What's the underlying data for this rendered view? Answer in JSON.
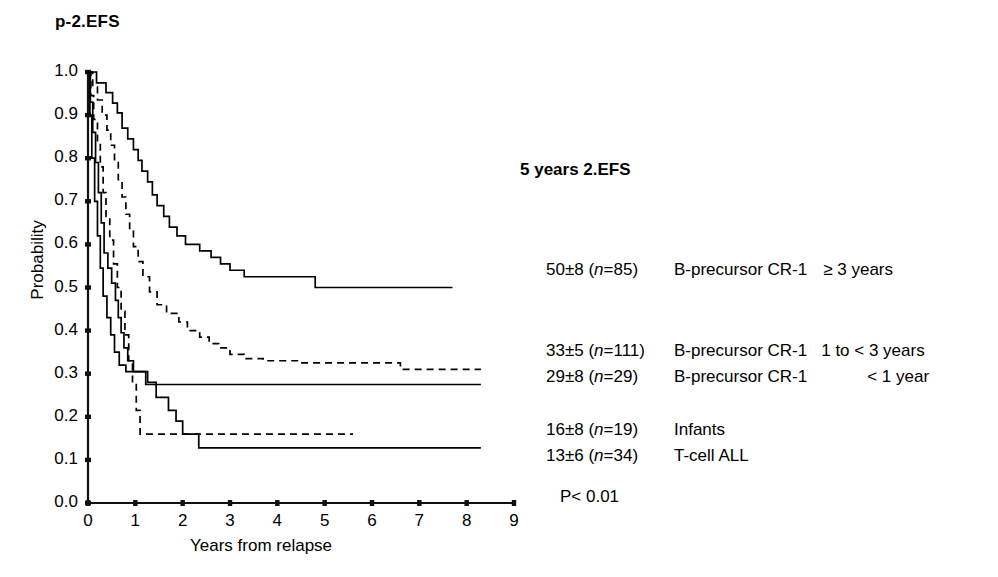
{
  "panel": {
    "title": "p-2.EFS"
  },
  "axes": {
    "ylabel": "Probability",
    "xlabel": "Years from relapse",
    "yticks": [
      "0.0",
      "0.1",
      "0.2",
      "0.3",
      "0.4",
      "0.5",
      "0.6",
      "0.7",
      "0.8",
      "0.9",
      "1.0"
    ],
    "xticks": [
      "0",
      "1",
      "2",
      "3",
      "4",
      "5",
      "6",
      "7",
      "8",
      "9"
    ]
  },
  "legend": {
    "title": "5 years 2.EFS",
    "pvalue": "P< 0.01",
    "entries": [
      {
        "stat": "50±8 (",
        "n_italic": "n",
        "stat_tail": "=85)",
        "group": "B-precursor CR-1",
        "duration": "≥ 3 years"
      },
      {
        "stat": "33±5 (",
        "n_italic": "n",
        "stat_tail": "=111)",
        "group": "B-precursor CR-1",
        "duration": "1 to < 3 years"
      },
      {
        "stat": "29±8 (",
        "n_italic": "n",
        "stat_tail": "=29)",
        "group": "B-precursor CR-1",
        "duration": "< 1 year"
      },
      {
        "stat": "16±8 (",
        "n_italic": "n",
        "stat_tail": "=19)",
        "group": "Infants",
        "duration": ""
      },
      {
        "stat": "13±6 (",
        "n_italic": "n",
        "stat_tail": "=34)",
        "group": "T-cell ALL",
        "duration": ""
      }
    ]
  },
  "chart_data": {
    "type": "line",
    "subtype": "kaplan-meier-step",
    "title": "p-2.EFS",
    "xlabel": "Years from relapse",
    "ylabel": "Probability",
    "xlim": [
      0,
      9
    ],
    "ylim": [
      0.0,
      1.0
    ],
    "xtick_values": [
      0,
      1,
      2,
      3,
      4,
      5,
      6,
      7,
      8,
      9
    ],
    "ytick_values": [
      0.0,
      0.1,
      0.2,
      0.3,
      0.4,
      0.5,
      0.6,
      0.7,
      0.8,
      0.9,
      1.0
    ],
    "grid": false,
    "legend_position": "right",
    "annotations": [
      "P< 0.01",
      "5 years 2.EFS"
    ],
    "series": [
      {
        "name": "B-precursor CR-1 ≥ 3 years",
        "n": 85,
        "five_year_efs": 50,
        "five_year_efs_se": 8,
        "style": "solid",
        "color": "#000000",
        "points": [
          [
            0.0,
            1.0
          ],
          [
            0.18,
            1.0
          ],
          [
            0.18,
            0.975
          ],
          [
            0.38,
            0.975
          ],
          [
            0.38,
            0.952
          ],
          [
            0.52,
            0.952
          ],
          [
            0.52,
            0.928
          ],
          [
            0.62,
            0.928
          ],
          [
            0.62,
            0.905
          ],
          [
            0.72,
            0.905
          ],
          [
            0.72,
            0.87
          ],
          [
            0.84,
            0.87
          ],
          [
            0.84,
            0.845
          ],
          [
            0.96,
            0.845
          ],
          [
            0.96,
            0.82
          ],
          [
            1.06,
            0.82
          ],
          [
            1.06,
            0.795
          ],
          [
            1.14,
            0.795
          ],
          [
            1.14,
            0.77
          ],
          [
            1.26,
            0.77
          ],
          [
            1.26,
            0.745
          ],
          [
            1.36,
            0.745
          ],
          [
            1.36,
            0.715
          ],
          [
            1.46,
            0.715
          ],
          [
            1.46,
            0.69
          ],
          [
            1.6,
            0.69
          ],
          [
            1.6,
            0.665
          ],
          [
            1.72,
            0.665
          ],
          [
            1.72,
            0.64
          ],
          [
            1.88,
            0.64
          ],
          [
            1.88,
            0.62
          ],
          [
            2.06,
            0.62
          ],
          [
            2.06,
            0.6
          ],
          [
            2.36,
            0.6
          ],
          [
            2.36,
            0.585
          ],
          [
            2.6,
            0.585
          ],
          [
            2.6,
            0.57
          ],
          [
            2.8,
            0.57
          ],
          [
            2.8,
            0.555
          ],
          [
            3.0,
            0.555
          ],
          [
            3.0,
            0.54
          ],
          [
            3.3,
            0.54
          ],
          [
            3.3,
            0.525
          ],
          [
            4.8,
            0.525
          ],
          [
            4.8,
            0.5
          ],
          [
            7.7,
            0.5
          ]
        ]
      },
      {
        "name": "B-precursor CR-1 1 to < 3 years",
        "n": 111,
        "five_year_efs": 33,
        "five_year_efs_se": 5,
        "style": "dashed",
        "color": "#000000",
        "points": [
          [
            0.0,
            1.0
          ],
          [
            0.1,
            1.0
          ],
          [
            0.1,
            0.965
          ],
          [
            0.2,
            0.965
          ],
          [
            0.2,
            0.935
          ],
          [
            0.3,
            0.935
          ],
          [
            0.3,
            0.9
          ],
          [
            0.4,
            0.9
          ],
          [
            0.4,
            0.865
          ],
          [
            0.48,
            0.865
          ],
          [
            0.48,
            0.83
          ],
          [
            0.56,
            0.83
          ],
          [
            0.56,
            0.79
          ],
          [
            0.64,
            0.79
          ],
          [
            0.64,
            0.75
          ],
          [
            0.72,
            0.75
          ],
          [
            0.72,
            0.71
          ],
          [
            0.8,
            0.71
          ],
          [
            0.8,
            0.67
          ],
          [
            0.88,
            0.67
          ],
          [
            0.88,
            0.63
          ],
          [
            0.96,
            0.63
          ],
          [
            0.96,
            0.595
          ],
          [
            1.06,
            0.595
          ],
          [
            1.06,
            0.56
          ],
          [
            1.16,
            0.56
          ],
          [
            1.16,
            0.525
          ],
          [
            1.3,
            0.525
          ],
          [
            1.3,
            0.49
          ],
          [
            1.46,
            0.49
          ],
          [
            1.46,
            0.46
          ],
          [
            1.66,
            0.46
          ],
          [
            1.66,
            0.44
          ],
          [
            1.92,
            0.44
          ],
          [
            1.92,
            0.42
          ],
          [
            2.1,
            0.42
          ],
          [
            2.1,
            0.4
          ],
          [
            2.36,
            0.4
          ],
          [
            2.36,
            0.385
          ],
          [
            2.56,
            0.385
          ],
          [
            2.56,
            0.37
          ],
          [
            2.76,
            0.37
          ],
          [
            2.76,
            0.36
          ],
          [
            3.0,
            0.36
          ],
          [
            3.0,
            0.345
          ],
          [
            3.3,
            0.345
          ],
          [
            3.3,
            0.335
          ],
          [
            3.7,
            0.335
          ],
          [
            3.7,
            0.33
          ],
          [
            4.5,
            0.33
          ],
          [
            4.5,
            0.325
          ],
          [
            6.6,
            0.325
          ],
          [
            6.6,
            0.31
          ],
          [
            8.3,
            0.31
          ]
        ]
      },
      {
        "name": "B-precursor CR-1 < 1 year",
        "n": 29,
        "five_year_efs": 29,
        "five_year_efs_se": 8,
        "style": "solid",
        "color": "#000000",
        "points": [
          [
            0.0,
            1.0
          ],
          [
            0.05,
            1.0
          ],
          [
            0.05,
            0.93
          ],
          [
            0.1,
            0.93
          ],
          [
            0.1,
            0.86
          ],
          [
            0.16,
            0.86
          ],
          [
            0.16,
            0.79
          ],
          [
            0.22,
            0.79
          ],
          [
            0.22,
            0.72
          ],
          [
            0.28,
            0.72
          ],
          [
            0.28,
            0.65
          ],
          [
            0.34,
            0.65
          ],
          [
            0.34,
            0.58
          ],
          [
            0.42,
            0.58
          ],
          [
            0.42,
            0.545
          ],
          [
            0.5,
            0.545
          ],
          [
            0.5,
            0.51
          ],
          [
            0.58,
            0.51
          ],
          [
            0.58,
            0.47
          ],
          [
            0.64,
            0.47
          ],
          [
            0.64,
            0.43
          ],
          [
            0.7,
            0.43
          ],
          [
            0.7,
            0.395
          ],
          [
            0.76,
            0.395
          ],
          [
            0.76,
            0.36
          ],
          [
            0.84,
            0.36
          ],
          [
            0.84,
            0.33
          ],
          [
            0.96,
            0.33
          ],
          [
            0.96,
            0.305
          ],
          [
            1.22,
            0.305
          ],
          [
            1.22,
            0.275
          ],
          [
            8.3,
            0.275
          ]
        ]
      },
      {
        "name": "Infants",
        "n": 19,
        "five_year_efs": 16,
        "five_year_efs_se": 8,
        "style": "dashed",
        "color": "#000000",
        "points": [
          [
            0.0,
            1.0
          ],
          [
            0.06,
            1.0
          ],
          [
            0.06,
            0.945
          ],
          [
            0.12,
            0.945
          ],
          [
            0.12,
            0.89
          ],
          [
            0.2,
            0.89
          ],
          [
            0.2,
            0.835
          ],
          [
            0.26,
            0.835
          ],
          [
            0.26,
            0.78
          ],
          [
            0.32,
            0.78
          ],
          [
            0.32,
            0.72
          ],
          [
            0.38,
            0.72
          ],
          [
            0.38,
            0.665
          ],
          [
            0.46,
            0.665
          ],
          [
            0.46,
            0.61
          ],
          [
            0.54,
            0.61
          ],
          [
            0.54,
            0.555
          ],
          [
            0.62,
            0.555
          ],
          [
            0.62,
            0.5
          ],
          [
            0.7,
            0.5
          ],
          [
            0.7,
            0.445
          ],
          [
            0.78,
            0.445
          ],
          [
            0.78,
            0.39
          ],
          [
            0.86,
            0.39
          ],
          [
            0.86,
            0.33
          ],
          [
            0.94,
            0.33
          ],
          [
            0.94,
            0.275
          ],
          [
            1.02,
            0.275
          ],
          [
            1.02,
            0.215
          ],
          [
            1.1,
            0.215
          ],
          [
            1.1,
            0.16
          ],
          [
            5.6,
            0.16
          ]
        ]
      },
      {
        "name": "T-cell ALL",
        "n": 34,
        "five_year_efs": 13,
        "five_year_efs_se": 6,
        "style": "solid",
        "color": "#000000",
        "points": [
          [
            0.0,
            1.0
          ],
          [
            0.04,
            1.0
          ],
          [
            0.04,
            0.9
          ],
          [
            0.08,
            0.9
          ],
          [
            0.08,
            0.8
          ],
          [
            0.14,
            0.8
          ],
          [
            0.14,
            0.7
          ],
          [
            0.2,
            0.7
          ],
          [
            0.2,
            0.62
          ],
          [
            0.26,
            0.62
          ],
          [
            0.26,
            0.545
          ],
          [
            0.32,
            0.545
          ],
          [
            0.32,
            0.48
          ],
          [
            0.4,
            0.48
          ],
          [
            0.4,
            0.43
          ],
          [
            0.48,
            0.43
          ],
          [
            0.48,
            0.39
          ],
          [
            0.56,
            0.39
          ],
          [
            0.56,
            0.35
          ],
          [
            0.66,
            0.35
          ],
          [
            0.66,
            0.32
          ],
          [
            0.8,
            0.32
          ],
          [
            0.8,
            0.305
          ],
          [
            1.26,
            0.305
          ],
          [
            1.26,
            0.28
          ],
          [
            1.44,
            0.28
          ],
          [
            1.44,
            0.245
          ],
          [
            1.7,
            0.245
          ],
          [
            1.7,
            0.215
          ],
          [
            1.86,
            0.215
          ],
          [
            1.86,
            0.19
          ],
          [
            2.0,
            0.19
          ],
          [
            2.0,
            0.16
          ],
          [
            2.34,
            0.16
          ],
          [
            2.34,
            0.128
          ],
          [
            8.3,
            0.128
          ]
        ]
      }
    ]
  }
}
